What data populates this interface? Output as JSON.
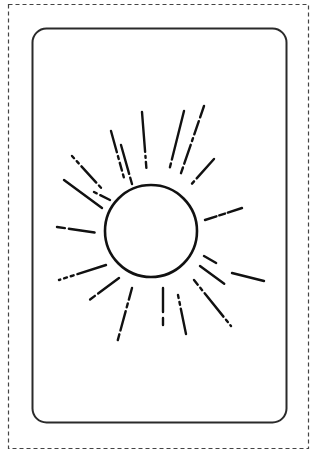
{
  "figure": {
    "colors": {
      "background": "#ffffff",
      "stroke": "#1a1a1a",
      "dashed_border": "#444444"
    },
    "ray_count": 20
  }
}
